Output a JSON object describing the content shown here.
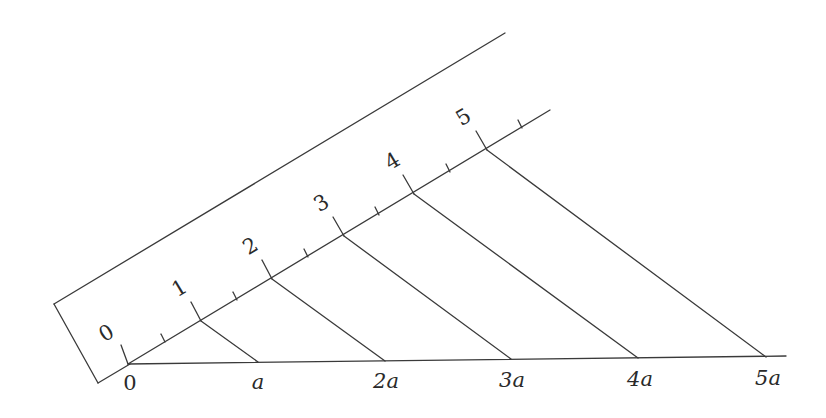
{
  "diagram": {
    "title": "",
    "line_color": "#3a3a3a",
    "background": "#ffffff",
    "ruler": {
      "scale_labels": [
        "0",
        "1",
        "2",
        "3",
        "4",
        "5"
      ]
    },
    "baseline": {
      "labels": [
        "0",
        "a",
        "2a",
        "3a",
        "4a",
        "5a"
      ]
    }
  }
}
